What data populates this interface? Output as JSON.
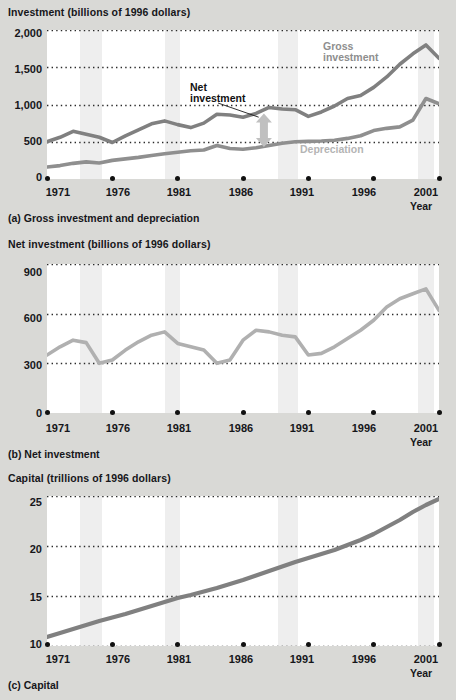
{
  "figure": {
    "panels": [
      {
        "id": "a",
        "axis_title": "Investment (billions of 1996 dollars)",
        "caption": "(a) Gross investment and depreciation",
        "xlabel": "Year",
        "annotations": {
          "gross": "Gross\ninvestment",
          "gross_line1": "Gross",
          "gross_line2": "investment",
          "net_line1": "Net",
          "net_line2": "investment",
          "depreciation": "Depreciation"
        }
      },
      {
        "id": "b",
        "axis_title": "Net investment (billions of 1996 dollars)",
        "caption": "(b) Net investment",
        "xlabel": "Year"
      },
      {
        "id": "c",
        "axis_title": "Capital (trillions of 1996 dollars)",
        "caption": "(c) Capital",
        "xlabel": "Year"
      }
    ],
    "colors": {
      "background": "#d9d9d6",
      "plot_background": "#ffffff",
      "recession_band": "#eeeeee",
      "gross_investment_line": "#808080",
      "depreciation_line": "#8f8f8f",
      "net_investment_line": "#b0b0b0",
      "capital_line": "#808080",
      "gridline": "#2a2a2a",
      "text": "#16161a"
    },
    "recession_bands": [
      {
        "start": 1973.5,
        "end": 1975.2
      },
      {
        "start": 1980.0,
        "end": 1981.2
      },
      {
        "start": 1988.7,
        "end": 1990.2
      },
      {
        "start": 1999.4,
        "end": 2000.6
      }
    ]
  },
  "chart_data": [
    {
      "type": "line",
      "title": "Investment (billions of 1996 dollars)",
      "subtitle": "(a) Gross investment and depreciation",
      "xlabel": "Year",
      "ylabel": "Investment (billions of 1996 dollars)",
      "xlim": [
        1971,
        2001
      ],
      "ylim": [
        0,
        2000
      ],
      "yticks": [
        0,
        500,
        1000,
        1500,
        2000
      ],
      "ytick_labels": [
        "0",
        "500",
        "1,000",
        "1,500",
        "2,000"
      ],
      "xticks": [
        1971,
        1976,
        1981,
        1986,
        1991,
        1996,
        2001
      ],
      "xtick_labels": [
        "1971",
        "1976",
        "1981",
        "1986",
        "1991",
        "1996",
        "2001"
      ],
      "grid": "horizontal-dotted",
      "legend": "inline-annotation",
      "x": [
        1971,
        1972,
        1973,
        1974,
        1975,
        1976,
        1977,
        1978,
        1979,
        1980,
        1981,
        1982,
        1983,
        1984,
        1985,
        1986,
        1987,
        1988,
        1989,
        1990,
        1991,
        1992,
        1993,
        1994,
        1995,
        1996,
        1997,
        1998,
        1999,
        2000,
        2001
      ],
      "series": [
        {
          "name": "Gross investment",
          "color": "#808080",
          "values": [
            500,
            560,
            640,
            600,
            560,
            490,
            580,
            660,
            740,
            780,
            730,
            690,
            750,
            870,
            860,
            830,
            880,
            960,
            940,
            930,
            840,
            900,
            980,
            1080,
            1120,
            1230,
            1370,
            1540,
            1680,
            1800,
            1620
          ]
        },
        {
          "name": "Depreciation",
          "color": "#8f8f8f",
          "values": [
            160,
            180,
            210,
            230,
            215,
            250,
            270,
            290,
            315,
            340,
            360,
            380,
            390,
            450,
            410,
            400,
            420,
            450,
            480,
            500,
            505,
            510,
            520,
            545,
            580,
            650,
            680,
            700,
            790,
            1080,
            1010
          ]
        }
      ]
    },
    {
      "type": "line",
      "title": "Net investment (billions of 1996 dollars)",
      "subtitle": "(b) Net investment",
      "xlabel": "Year",
      "ylabel": "Net investment (billions of 1996 dollars)",
      "xlim": [
        1971,
        2001
      ],
      "ylim": [
        0,
        900
      ],
      "yticks": [
        0,
        300,
        600,
        900
      ],
      "ytick_labels": [
        "0",
        "300",
        "600",
        "900"
      ],
      "xticks": [
        1971,
        1976,
        1981,
        1986,
        1991,
        1996,
        2001
      ],
      "xtick_labels": [
        "1971",
        "1976",
        "1981",
        "1986",
        "1991",
        "1996",
        "2001"
      ],
      "grid": "horizontal-dotted",
      "x": [
        1971,
        1972,
        1973,
        1974,
        1975,
        1976,
        1977,
        1978,
        1979,
        1980,
        1981,
        1982,
        1983,
        1984,
        1985,
        1986,
        1987,
        1988,
        1989,
        1990,
        1991,
        1992,
        1993,
        1994,
        1995,
        1996,
        1997,
        1998,
        1999,
        2000,
        2001
      ],
      "series": [
        {
          "name": "Net investment",
          "color": "#b0b0b0",
          "values": [
            350,
            400,
            440,
            425,
            300,
            320,
            380,
            430,
            470,
            490,
            420,
            400,
            380,
            300,
            320,
            440,
            500,
            490,
            470,
            460,
            350,
            360,
            400,
            450,
            500,
            560,
            640,
            690,
            720,
            750,
            620
          ]
        }
      ]
    },
    {
      "type": "line",
      "title": "Capital (trillions of 1996 dollars)",
      "subtitle": "(c) Capital",
      "xlabel": "Year",
      "ylabel": "Capital (trillions of 1996 dollars)",
      "xlim": [
        1971,
        2001
      ],
      "ylim": [
        10,
        25
      ],
      "yticks": [
        10,
        15,
        20,
        25
      ],
      "ytick_labels": [
        "10",
        "15",
        "20",
        "25"
      ],
      "xticks": [
        1971,
        1976,
        1981,
        1986,
        1991,
        1996,
        2001
      ],
      "xtick_labels": [
        "1971",
        "1976",
        "1981",
        "1986",
        "1991",
        "1996",
        "2001"
      ],
      "grid": "horizontal-dotted",
      "x": [
        1971,
        1972,
        1973,
        1974,
        1975,
        1976,
        1977,
        1978,
        1979,
        1980,
        1981,
        1982,
        1983,
        1984,
        1985,
        1986,
        1987,
        1988,
        1989,
        1990,
        1991,
        1992,
        1993,
        1994,
        1995,
        1996,
        1997,
        1998,
        1999,
        2000,
        2001
      ],
      "series": [
        {
          "name": "Capital",
          "color": "#808080",
          "values": [
            10.9,
            11.3,
            11.7,
            12.1,
            12.5,
            12.85,
            13.2,
            13.6,
            14.0,
            14.4,
            14.8,
            15.1,
            15.45,
            15.8,
            16.2,
            16.6,
            17.05,
            17.5,
            17.95,
            18.4,
            18.8,
            19.2,
            19.6,
            20.1,
            20.6,
            21.2,
            21.9,
            22.6,
            23.4,
            24.1,
            24.7
          ]
        }
      ]
    }
  ]
}
